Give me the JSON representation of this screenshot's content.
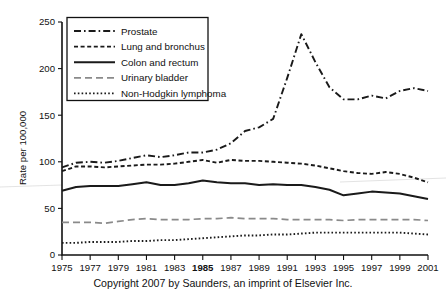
{
  "caption": "Copyright 2007 by Saunders, an imprint of Elsevier Inc.",
  "axis": {
    "ylabel": "Rate per 100,000",
    "yticks": [
      "0",
      "50",
      "100",
      "150",
      "200",
      "250"
    ],
    "xticks": [
      "1975",
      "1977",
      "1979",
      "1981",
      "1983",
      "1985",
      "1987",
      "1989",
      "1991",
      "1993",
      "1995",
      "1997",
      "1999",
      "2001"
    ],
    "bold_xtick": "1985"
  },
  "legend": {
    "items": [
      {
        "label": "Prostate",
        "style": "dash-dot",
        "color": "#1a1a1a"
      },
      {
        "label": "Lung and bronchus",
        "style": "dashed-short",
        "color": "#1a1a1a"
      },
      {
        "label": "Colon and rectum",
        "style": "solid",
        "color": "#1a1a1a"
      },
      {
        "label": "Urinary bladder",
        "style": "dashed-long",
        "color": "#8a8a8a"
      },
      {
        "label": "Non-Hodgkin lymphoma",
        "style": "dotted",
        "color": "#1a1a1a"
      }
    ]
  },
  "chart_data": {
    "type": "line",
    "title": "",
    "xlabel": "",
    "ylabel": "Rate per 100,000",
    "xlim": [
      1975,
      2001
    ],
    "ylim": [
      0,
      250
    ],
    "grid": false,
    "legend_position": "top-left",
    "x": [
      1975,
      1976,
      1977,
      1978,
      1979,
      1980,
      1981,
      1982,
      1983,
      1984,
      1985,
      1986,
      1987,
      1988,
      1989,
      1990,
      1991,
      1992,
      1993,
      1994,
      1995,
      1996,
      1997,
      1998,
      1999,
      2000,
      2001
    ],
    "series": [
      {
        "name": "Prostate",
        "values": [
          94,
          99,
          100,
          99,
          101,
          104,
          107,
          105,
          107,
          110,
          110,
          113,
          120,
          133,
          137,
          146,
          190,
          237,
          207,
          180,
          167,
          167,
          171,
          168,
          176,
          179,
          176
        ]
      },
      {
        "name": "Lung and bronchus",
        "values": [
          90,
          95,
          95,
          94,
          95,
          96,
          97,
          97,
          98,
          100,
          102,
          99,
          102,
          101,
          101,
          100,
          99,
          98,
          96,
          93,
          90,
          88,
          87,
          89,
          87,
          83,
          78
        ]
      },
      {
        "name": "Colon and rectum",
        "values": [
          69,
          73,
          74,
          74,
          74,
          76,
          78,
          75,
          75,
          77,
          80,
          78,
          77,
          77,
          75,
          76,
          75,
          75,
          73,
          70,
          64,
          66,
          68,
          67,
          66,
          63,
          60
        ]
      },
      {
        "name": "Urinary bladder",
        "values": [
          35,
          35,
          35,
          34,
          36,
          38,
          39,
          38,
          38,
          38,
          39,
          39,
          40,
          39,
          39,
          39,
          38,
          38,
          38,
          38,
          37,
          38,
          38,
          38,
          38,
          38,
          37
        ]
      },
      {
        "name": "Non-Hodgkin lymphoma",
        "values": [
          13,
          13,
          14,
          14,
          14,
          15,
          15,
          16,
          16,
          17,
          18,
          19,
          20,
          21,
          21,
          22,
          22,
          23,
          24,
          24,
          24,
          24,
          24,
          24,
          24,
          23,
          22
        ]
      }
    ]
  }
}
